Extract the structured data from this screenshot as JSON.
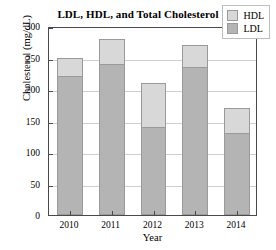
{
  "chart_data": {
    "type": "bar",
    "subtype": "stacked-vertical-bar",
    "title": "LDL, HDL, and Total Cholesterol",
    "xlabel": "Year",
    "ylabel": "Cholesterol (mg/dL)",
    "categories": [
      "2010",
      "2011",
      "2012",
      "2013",
      "2014"
    ],
    "series": [
      {
        "name": "LDL",
        "values": [
          220,
          240,
          140,
          235,
          130
        ],
        "color": "#b4b4b4"
      },
      {
        "name": "HDL",
        "values": [
          30,
          40,
          70,
          35,
          40
        ],
        "color": "#d8d8d8"
      }
    ],
    "totals": [
      250,
      280,
      210,
      270,
      170
    ],
    "ylim": [
      0,
      300
    ],
    "yticks": [
      0,
      50,
      100,
      150,
      200,
      250,
      300
    ],
    "ytick_labels": [
      "0",
      "50",
      "100",
      "150",
      "200",
      "250",
      "300"
    ],
    "grid": true,
    "grid_axis": "y",
    "legend_position": "top-right",
    "legend_entries": [
      "HDL",
      "LDL"
    ],
    "stack_order_bottom_to_top": [
      "LDL",
      "HDL"
    ]
  },
  "legend": {
    "hdl_label": "HDL",
    "ldl_label": "LDL"
  }
}
